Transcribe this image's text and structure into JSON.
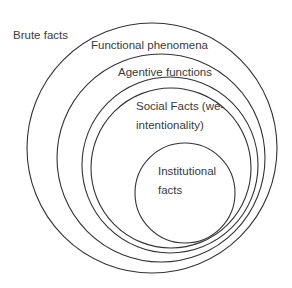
{
  "diagram": {
    "type": "nested-circles",
    "stroke_color": "#333333",
    "background": "#ffffff",
    "layers": [
      {
        "id": "brute",
        "label_lines": [
          "Brute facts"
        ],
        "cx": 152,
        "cy": 148,
        "r": 125,
        "label_x": 13,
        "label_y": 26
      },
      {
        "id": "functional",
        "label_lines": [
          "Functional phenomena"
        ],
        "cx": 161,
        "cy": 158,
        "r": 103,
        "label_x": 91,
        "label_y": 35
      },
      {
        "id": "agentive",
        "label_lines": [
          "Agentive functions"
        ],
        "cx": 171,
        "cy": 168,
        "r": 85,
        "label_x": 118,
        "label_y": 63
      },
      {
        "id": "social",
        "label_lines": [
          "Social Facts (we-",
          "intentionality)"
        ],
        "cx": 178,
        "cy": 174,
        "r": 76,
        "label_x": 136,
        "label_y": 97
      },
      {
        "id": "institutional",
        "label_lines": [
          "Institutional",
          "facts"
        ],
        "cx": 185,
        "cy": 193,
        "r": 50,
        "label_x": 158,
        "label_y": 162
      }
    ]
  }
}
